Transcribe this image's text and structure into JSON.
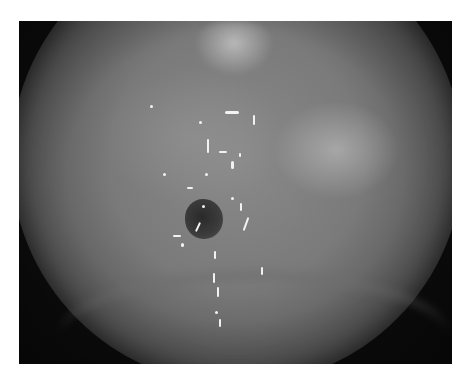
{
  "image": {
    "description": "Grayscale endoscopic view of mucosal tissue with a central dark opening and specular highlights",
    "colors": {
      "background": "#ffffff",
      "frame": "#0c0c0c",
      "tissue_mid": "#7a7a7a",
      "tissue_bright": "#c8c8c8",
      "lumen": "#2a2a2a",
      "glint": "#f2f2f2"
    }
  }
}
